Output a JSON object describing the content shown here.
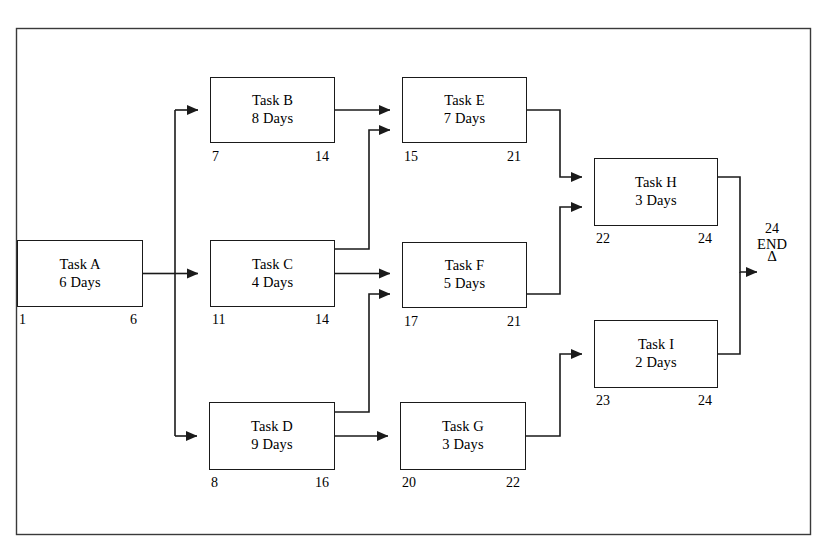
{
  "diagram": {
    "type": "project-network-diagram",
    "frame": {
      "x": 16,
      "y": 28,
      "width": 795,
      "height": 507
    },
    "line_color": "#1a1a1a",
    "background": "#ffffff",
    "nodes": [
      {
        "id": "A",
        "name": "Task A",
        "duration": "6 Days",
        "early_start": "1",
        "early_finish": "6",
        "x": 17,
        "y": 240,
        "w": 126,
        "h": 67
      },
      {
        "id": "B",
        "name": "Task B",
        "duration": "8 Days",
        "early_start": "7",
        "early_finish": "14",
        "x": 210,
        "y": 77,
        "w": 125,
        "h": 66
      },
      {
        "id": "C",
        "name": "Task C",
        "duration": "4 Days",
        "early_start": "11",
        "early_finish": "14",
        "x": 210,
        "y": 240,
        "w": 125,
        "h": 67
      },
      {
        "id": "D",
        "name": "Task D",
        "duration": "9 Days",
        "early_start": "8",
        "early_finish": "16",
        "x": 209,
        "y": 402,
        "w": 126,
        "h": 68
      },
      {
        "id": "E",
        "name": "Task E",
        "duration": "7 Days",
        "early_start": "15",
        "early_finish": "21",
        "x": 402,
        "y": 77,
        "w": 125,
        "h": 66
      },
      {
        "id": "F",
        "name": "Task F",
        "duration": "5 Days",
        "early_start": "17",
        "early_finish": "21",
        "x": 402,
        "y": 242,
        "w": 125,
        "h": 66
      },
      {
        "id": "G",
        "name": "Task G",
        "duration": "3 Days",
        "early_start": "20",
        "early_finish": "22",
        "x": 400,
        "y": 402,
        "w": 126,
        "h": 68
      },
      {
        "id": "H",
        "name": "Task H",
        "duration": "3 Days",
        "early_start": "22",
        "early_finish": "24",
        "x": 594,
        "y": 158,
        "w": 124,
        "h": 68
      },
      {
        "id": "I",
        "name": "Task I",
        "duration": "2 Days",
        "early_start": "23",
        "early_finish": "24",
        "x": 594,
        "y": 320,
        "w": 124,
        "h": 68
      }
    ],
    "end_marker": {
      "number": "24",
      "label": "END",
      "symbol": "Δ",
      "x": 749,
      "y": 222
    },
    "edges": [
      {
        "from": "A",
        "to": "B"
      },
      {
        "from": "A",
        "to": "C"
      },
      {
        "from": "A",
        "to": "D"
      },
      {
        "from": "B",
        "to": "E"
      },
      {
        "from": "C",
        "to": "E"
      },
      {
        "from": "C",
        "to": "F"
      },
      {
        "from": "D",
        "to": "F"
      },
      {
        "from": "D",
        "to": "G"
      },
      {
        "from": "E",
        "to": "H"
      },
      {
        "from": "F",
        "to": "H"
      },
      {
        "from": "G",
        "to": "I"
      },
      {
        "from": "H",
        "to": "END"
      },
      {
        "from": "I",
        "to": "END"
      }
    ]
  }
}
